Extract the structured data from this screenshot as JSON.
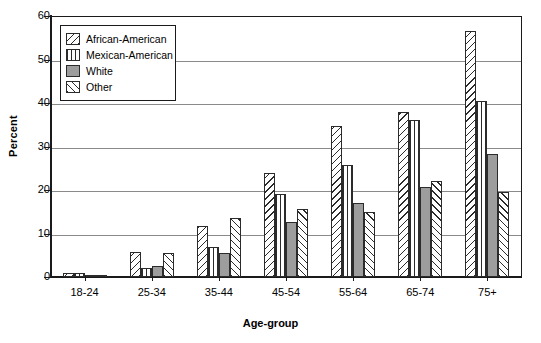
{
  "chart_data": {
    "type": "bar",
    "title": "",
    "xlabel": "Age-group",
    "ylabel": "Percent",
    "categories": [
      "18-24",
      "25-34",
      "35-44",
      "45-54",
      "55-64",
      "65-74",
      "75+"
    ],
    "ylim": [
      0,
      60
    ],
    "yticks": [
      0,
      10,
      20,
      30,
      40,
      50,
      60
    ],
    "grid": true,
    "legend_position": "upper-left-inside",
    "series": [
      {
        "name": "African-American",
        "pattern": "diagonal-hatch-backslash",
        "values": [
          1.0,
          5.7,
          11.7,
          23.8,
          34.7,
          37.9,
          56.6
        ]
      },
      {
        "name": "Mexican-American",
        "pattern": "vertical-lines",
        "values": [
          1.0,
          2.1,
          6.9,
          19.1,
          25.7,
          36.1,
          40.5
        ]
      },
      {
        "name": "White",
        "pattern": "solid-gray",
        "values": [
          0.3,
          2.5,
          5.5,
          12.6,
          17.1,
          20.8,
          28.3
        ]
      },
      {
        "name": "Other",
        "pattern": "diagonal-hatch-slash",
        "values": [
          0.3,
          5.5,
          13.6,
          15.6,
          14.9,
          22.1,
          19.5
        ]
      }
    ]
  },
  "colors": {
    "axis": "#1a1a1a",
    "gridline": "#8a8a8a",
    "bar_outline": "#2b2b2b",
    "white_series_fill": "#9d9d9d",
    "background": "#ffffff"
  }
}
